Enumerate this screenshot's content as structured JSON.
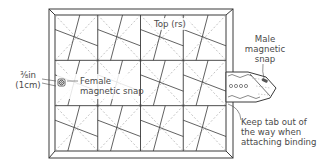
{
  "diagram": {
    "type": "quilt-construction-diagram",
    "grid": {
      "columns": 4,
      "rows": 3
    },
    "colors": {
      "line": "#3a3a3a",
      "dashed": "#9a9a9a",
      "text": "#4a4a4a",
      "background": "#ffffff"
    }
  },
  "labels": {
    "top": "Top (rs)",
    "male_snap": [
      "Male",
      "magnetic",
      "snap"
    ],
    "female_snap": [
      "Female",
      "magnetic snap"
    ],
    "measurement": [
      "⅜in",
      "(1cm)"
    ],
    "tab_note": [
      "Keep tab out of",
      "the way when",
      "attaching binding"
    ]
  }
}
